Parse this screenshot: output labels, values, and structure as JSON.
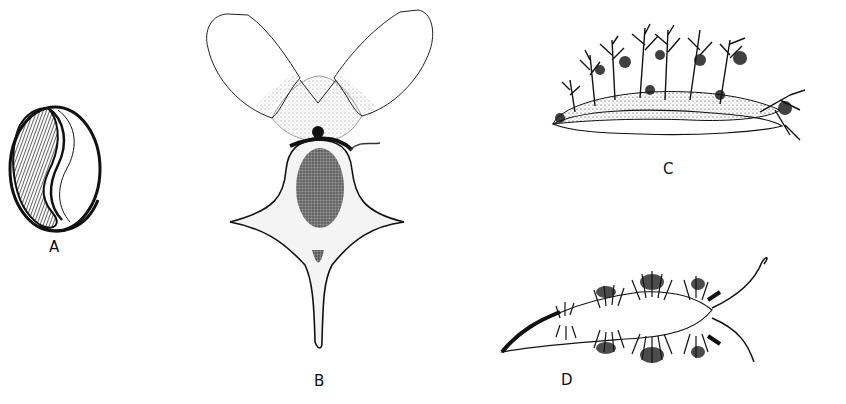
{
  "plate": {
    "figures": [
      {
        "id": "A",
        "label": "A",
        "subject": "cowrie-like shell (dorsal view, aperture shown)"
      },
      {
        "id": "B",
        "label": "B",
        "subject": "pteropod / sea butterfly with paired wing-like parapodia"
      },
      {
        "id": "C",
        "label": "C",
        "subject": "nudibranch with branched dendritic cerata (lateral view)"
      },
      {
        "id": "D",
        "label": "D",
        "subject": "aeolid nudibranch with clustered cerata (dorsal view)"
      }
    ],
    "colors": {
      "ink": "#111111",
      "paper": "#ffffff"
    }
  }
}
